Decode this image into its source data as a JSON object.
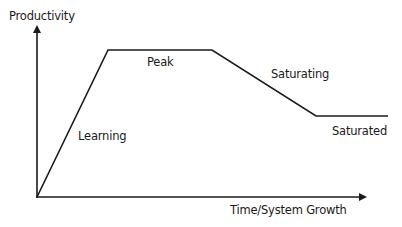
{
  "diagram": {
    "y_axis_label": "Productivity",
    "x_axis_label": "Time/System Growth",
    "phases": [
      {
        "label": "Learning"
      },
      {
        "label": "Peak"
      },
      {
        "label": "Saturating"
      },
      {
        "label": "Saturated"
      }
    ],
    "curve_points": [
      [
        37,
        197
      ],
      [
        108,
        50
      ],
      [
        212,
        50
      ],
      [
        316,
        116
      ],
      [
        388,
        116
      ]
    ],
    "colors": {
      "line": "#1a1a1a",
      "background": "#ffffff"
    }
  }
}
